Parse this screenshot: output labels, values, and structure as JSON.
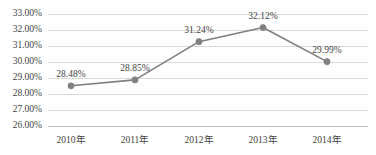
{
  "chart_data": {
    "type": "line",
    "title": "",
    "subtitle": "",
    "xlabel": "",
    "ylabel": "",
    "categories": [
      "2010年",
      "2011年",
      "2012年",
      "2013年",
      "2014年"
    ],
    "values": [
      28.48,
      28.85,
      31.24,
      32.12,
      29.99
    ],
    "point_labels": [
      "28.48%",
      "28.85%",
      "31.24%",
      "32.12%",
      "29.99%"
    ],
    "ylim": [
      26.0,
      33.0
    ],
    "ytick_values": [
      33.0,
      32.0,
      31.0,
      30.0,
      29.0,
      28.0,
      27.0,
      26.0
    ],
    "ytick_labels": [
      "33.00%",
      "32.00%",
      "31.00%",
      "30.00%",
      "29.00%",
      "28.00%",
      "27.00%",
      "26.00%"
    ],
    "grid": true,
    "legend": "none",
    "series": [
      {
        "name": "",
        "values": [
          28.48,
          28.85,
          31.24,
          32.12,
          29.99
        ]
      }
    ],
    "colors": {
      "line": "#7f7f7f",
      "marker": "#808080",
      "gridline": "#d9d9d9",
      "axisline": "#bfbfbf",
      "text": "#3f3f3f",
      "background": "#ffffff"
    }
  }
}
